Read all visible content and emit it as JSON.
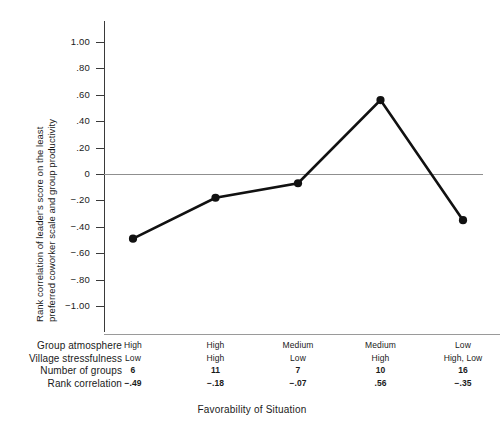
{
  "chart_data": {
    "type": "line",
    "title": "",
    "xlabel": "Favorability of Situation",
    "ylabel_line1": "Rank correlation of leader's score on the least",
    "ylabel_line2": "preferred coworker scale and group productivity",
    "ylim": [
      -1.0,
      1.0
    ],
    "yticks": [
      "1.00",
      ".80",
      ".60",
      ".40",
      ".20",
      "0",
      "−.20",
      "−.40",
      "−.60",
      "−.80",
      "−1.00"
    ],
    "ytick_values": [
      1.0,
      0.8,
      0.6,
      0.4,
      0.2,
      0,
      -0.2,
      -0.4,
      -0.6,
      -0.8,
      -1.0
    ],
    "grid": false,
    "legend": "none",
    "zero_reference_line": true,
    "categories": [
      "1",
      "2",
      "3",
      "4",
      "5"
    ],
    "values": [
      -0.49,
      -0.18,
      -0.07,
      0.56,
      -0.35
    ],
    "point_labels": [
      "−.49",
      "−.18",
      "−.07",
      ".56",
      "−.35"
    ],
    "series": [
      {
        "name": "Rank correlation",
        "values": [
          -0.49,
          -0.18,
          -0.07,
          0.56,
          -0.35
        ]
      }
    ],
    "marker": "filled-circle",
    "line_color": "#111111"
  },
  "axis": {
    "y_title_line1": "Rank correlation of leader's score on the least",
    "y_title_line2": "preferred coworker scale and group productivity",
    "x_title": "Favorability of Situation"
  },
  "table": {
    "rows": [
      {
        "label": "Group atmosphere",
        "bold": false,
        "cells": [
          "High",
          "High",
          "Medium",
          "Medium",
          "Low"
        ]
      },
      {
        "label": "Village stressfulness",
        "bold": false,
        "cells": [
          "Low",
          "High",
          "Low",
          "High",
          "High, Low"
        ]
      },
      {
        "label": "Number of groups",
        "bold": true,
        "cells": [
          "6",
          "11",
          "7",
          "10",
          "16"
        ]
      },
      {
        "label": "Rank correlation",
        "bold": true,
        "cells": [
          "−.49",
          "−.18",
          "−.07",
          ".56",
          "−.35"
        ]
      }
    ]
  },
  "misc": {
    "title_remnant": ""
  }
}
